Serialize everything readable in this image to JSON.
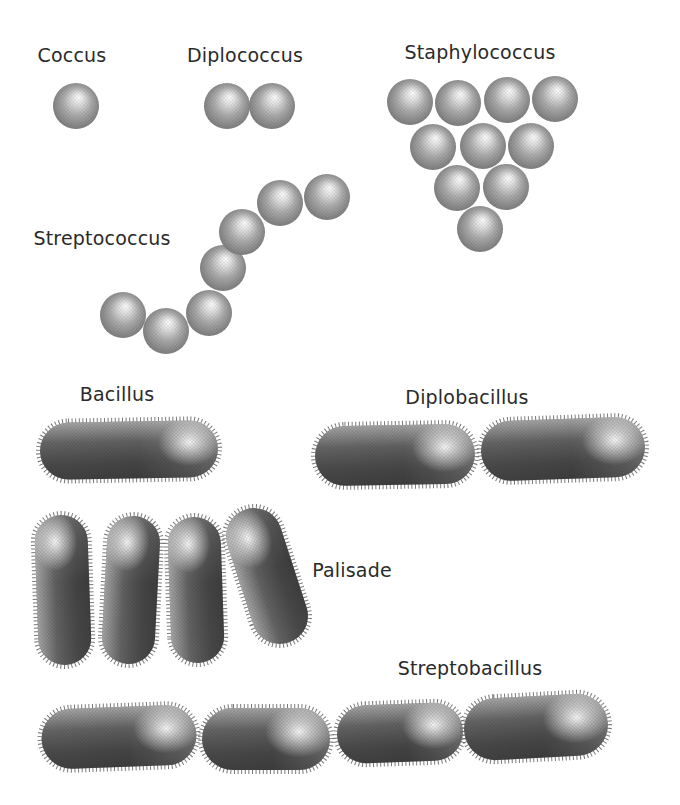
{
  "figure": {
    "colors": {
      "background": "#ffffff",
      "ink": "#2a2a2a",
      "sphere_edge": "#6e6e6e",
      "sphere_mid": "#ababab",
      "sphere_highlight": "#ffffff",
      "rod_body": "#4c4c4c",
      "rod_light_end": "#757575",
      "rod_highlight": "#f5f5f5",
      "fimbriae_fringe": "#616161"
    },
    "sections": [
      {
        "id": "coccus",
        "label": "Coccus",
        "label_pos": {
          "x": 72,
          "y": 55
        },
        "arrangement": "single spherical cell",
        "spheres": [
          {
            "cx": 76,
            "cy": 106,
            "r": 23
          }
        ]
      },
      {
        "id": "diplococcus",
        "label": "Diplococcus",
        "label_pos": {
          "x": 245,
          "y": 55
        },
        "arrangement": "pair of spherical cells",
        "spheres": [
          {
            "cx": 227,
            "cy": 106,
            "r": 23
          },
          {
            "cx": 272,
            "cy": 106,
            "r": 23
          }
        ]
      },
      {
        "id": "staphylococcus",
        "label": "Staphylococcus",
        "label_pos": {
          "x": 480,
          "y": 52
        },
        "arrangement": "grape-like triangular cluster of 10 spherical cells (rows of 4, 3, 2, 1)",
        "spheres": [
          {
            "cx": 410,
            "cy": 102,
            "r": 23
          },
          {
            "cx": 458,
            "cy": 103,
            "r": 23
          },
          {
            "cx": 507,
            "cy": 100,
            "r": 23
          },
          {
            "cx": 555,
            "cy": 99,
            "r": 23
          },
          {
            "cx": 433,
            "cy": 147,
            "r": 23
          },
          {
            "cx": 483,
            "cy": 146,
            "r": 23
          },
          {
            "cx": 531,
            "cy": 146,
            "r": 23
          },
          {
            "cx": 457,
            "cy": 188,
            "r": 23
          },
          {
            "cx": 506,
            "cy": 187,
            "r": 23
          },
          {
            "cx": 480,
            "cy": 229,
            "r": 23
          }
        ]
      },
      {
        "id": "streptococcus",
        "label": "Streptococcus",
        "label_pos": {
          "x": 102,
          "y": 238
        },
        "arrangement": "S-shaped chain of 7 spherical cells",
        "spheres": [
          {
            "cx": 223,
            "cy": 268,
            "r": 23
          },
          {
            "cx": 209,
            "cy": 313,
            "r": 23
          },
          {
            "cx": 242,
            "cy": 232,
            "r": 23
          },
          {
            "cx": 123,
            "cy": 315,
            "r": 23
          },
          {
            "cx": 166,
            "cy": 331,
            "r": 23
          },
          {
            "cx": 280,
            "cy": 203,
            "r": 23
          },
          {
            "cx": 327,
            "cy": 197,
            "r": 23
          }
        ]
      },
      {
        "id": "bacillus",
        "label": "Bacillus",
        "label_pos": {
          "x": 117,
          "y": 394
        },
        "arrangement": "single rod-shaped cell",
        "rods": [
          {
            "cx": 129,
            "cy": 450,
            "len": 178,
            "th": 57,
            "rot": -1
          }
        ]
      },
      {
        "id": "diplobacillus",
        "label": "Diplobacillus",
        "label_pos": {
          "x": 467,
          "y": 397
        },
        "arrangement": "pair of rod-shaped cells end to end",
        "rods": [
          {
            "cx": 395,
            "cy": 455,
            "len": 160,
            "th": 60,
            "rot": -1
          },
          {
            "cx": 563,
            "cy": 449,
            "len": 164,
            "th": 60,
            "rot": -2
          }
        ]
      },
      {
        "id": "palisade",
        "label": "Palisade",
        "label_pos": {
          "x": 352,
          "y": 570
        },
        "arrangement": "4 rod-shaped cells stacked side by side, nearly vertical",
        "rods": [
          {
            "cx": 63,
            "cy": 590,
            "len": 150,
            "th": 53,
            "rot": -92
          },
          {
            "cx": 131,
            "cy": 590,
            "len": 148,
            "th": 53,
            "rot": -87
          },
          {
            "cx": 196,
            "cy": 590,
            "len": 146,
            "th": 53,
            "rot": -92
          },
          {
            "cx": 267,
            "cy": 576,
            "len": 140,
            "th": 56,
            "rot": -108
          }
        ]
      },
      {
        "id": "streptobacillus",
        "label": "Streptobacillus",
        "label_pos": {
          "x": 470,
          "y": 668
        },
        "arrangement": "chain of 4 rod-shaped cells end to end",
        "rods": [
          {
            "cx": 119,
            "cy": 737,
            "len": 155,
            "th": 60,
            "rot": -2
          },
          {
            "cx": 266,
            "cy": 739,
            "len": 128,
            "th": 62,
            "rot": 0
          },
          {
            "cx": 400,
            "cy": 733,
            "len": 126,
            "th": 58,
            "rot": -2
          },
          {
            "cx": 536,
            "cy": 727,
            "len": 144,
            "th": 62,
            "rot": -3
          }
        ]
      }
    ]
  }
}
